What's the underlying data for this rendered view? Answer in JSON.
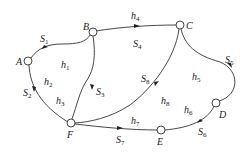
{
  "nodes": [
    {
      "id": "A",
      "label": "A",
      "x": 28,
      "y": 61
    },
    {
      "id": "B",
      "label": "B",
      "x": 93,
      "y": 32
    },
    {
      "id": "C",
      "label": "C",
      "x": 180,
      "y": 25
    },
    {
      "id": "D",
      "label": "D",
      "x": 216,
      "y": 103
    },
    {
      "id": "E",
      "label": "E",
      "x": 161,
      "y": 130
    },
    {
      "id": "F",
      "label": "F",
      "x": 71,
      "y": 123
    }
  ],
  "edge_labels": {
    "S1": {
      "base": "S",
      "sub": "1"
    },
    "S2": {
      "base": "S",
      "sub": "2"
    },
    "S3": {
      "base": "S",
      "sub": "3"
    },
    "S4": {
      "base": "S",
      "sub": "4"
    },
    "S5": {
      "base": "S",
      "sub": "5"
    },
    "S6": {
      "base": "S",
      "sub": "6"
    },
    "S7": {
      "base": "S",
      "sub": "7"
    },
    "S8": {
      "base": "S",
      "sub": "8"
    }
  },
  "region_labels": {
    "h1": {
      "base": "h",
      "sub": "1"
    },
    "h2": {
      "base": "h",
      "sub": "2"
    },
    "h3": {
      "base": "h",
      "sub": "3"
    },
    "h4": {
      "base": "h",
      "sub": "4"
    },
    "h5": {
      "base": "h",
      "sub": "5"
    },
    "h6": {
      "base": "h",
      "sub": "6"
    },
    "h7": {
      "base": "h",
      "sub": "7"
    },
    "h8": {
      "base": "h",
      "sub": "8"
    }
  }
}
